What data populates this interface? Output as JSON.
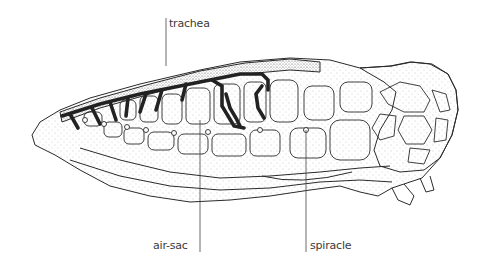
{
  "figure": {
    "labels": {
      "trachea": "trachea",
      "air_sac": "air-sac",
      "spiracle": "spiracle"
    },
    "colors": {
      "background": "#ffffff",
      "line": "#2a2a2a",
      "trachea_fill": "#222222",
      "stipple": "#8a8a8a",
      "label_text": "#3a3a3a"
    }
  }
}
